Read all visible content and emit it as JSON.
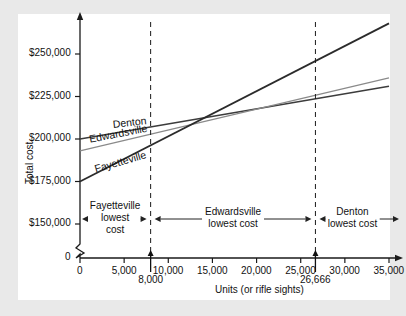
{
  "chart_data": {
    "type": "line",
    "title": "",
    "xlabel": "Units (or rifle sights)",
    "ylabel": "Total cost",
    "xlim": [
      0,
      35000
    ],
    "ylim": [
      140000,
      270000
    ],
    "grid": false,
    "y_axis_break": true,
    "legend": "inline-line-labels",
    "xticks": [
      0,
      5000,
      10000,
      15000,
      20000,
      25000,
      30000,
      35000
    ],
    "xtick_labels": [
      "0",
      "5,000",
      "10,000",
      "15,000",
      "20,000",
      "25,000",
      "30,000",
      "35,000"
    ],
    "yticks": [
      150000,
      175000,
      200000,
      225000,
      250000
    ],
    "ytick_labels": [
      "$150,000",
      "$175,000",
      "$200,000",
      "$225,000",
      "$250,000"
    ],
    "y_origin_label": "0",
    "series": [
      {
        "name": "Denton",
        "color": "#3c3c3c",
        "width": 1.4,
        "points": [
          [
            0,
            200000
          ],
          [
            35000,
            231000
          ]
        ]
      },
      {
        "name": "Edwardsville",
        "color": "#8a8a8a",
        "width": 1.2,
        "points": [
          [
            0,
            193000
          ],
          [
            35000,
            236000
          ]
        ]
      },
      {
        "name": "Fayetteville",
        "color": "#2b2b2b",
        "width": 1.8,
        "points": [
          [
            0,
            175000
          ],
          [
            35000,
            268000
          ]
        ]
      }
    ],
    "annotations": {
      "vertical_lines": [
        {
          "x": 8000,
          "label": "8,000",
          "style": "dashed"
        },
        {
          "x": 26666,
          "label": "26,666",
          "style": "dashed"
        }
      ],
      "regions": [
        {
          "from": 0,
          "to": 8000,
          "line1": "Fayetteville",
          "line2": "lowest",
          "line3": "cost"
        },
        {
          "from": 8000,
          "to": 26666,
          "line1": "Edwardsville",
          "line2": "lowest cost",
          "line3": ""
        },
        {
          "from": 26666,
          "to": 35000,
          "line1": "Denton",
          "line2": "lowest cost",
          "line3": ""
        }
      ]
    }
  },
  "colors": {
    "page_background": "#e9e9e9",
    "panel_background": "#ffffff",
    "axis": "#1a1a1a",
    "text": "#111111"
  }
}
